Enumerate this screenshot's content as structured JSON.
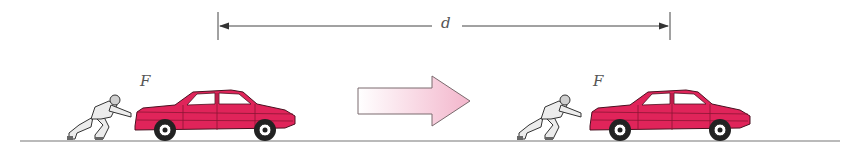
{
  "diagram": {
    "distance_label": "d",
    "force_label_left": "F",
    "force_label_right": "F",
    "colors": {
      "car_body": "#e0245a",
      "car_dark": "#a8163e",
      "ground": "#777777",
      "arrow_fill_start": "#ffffff",
      "arrow_fill_end": "#f3b6cc",
      "arrow_stroke": "#7a6a6e",
      "person": "#ececec",
      "outline": "#333333"
    },
    "elements": [
      {
        "type": "dimension-line",
        "label": "d",
        "x_start": 218,
        "x_end": 670,
        "y": 26
      },
      {
        "type": "person-pushing-car",
        "position": "start",
        "force": "F"
      },
      {
        "type": "direction-arrow",
        "direction": "right"
      },
      {
        "type": "person-pushing-car",
        "position": "end",
        "force": "F"
      },
      {
        "type": "ground-line"
      }
    ]
  }
}
